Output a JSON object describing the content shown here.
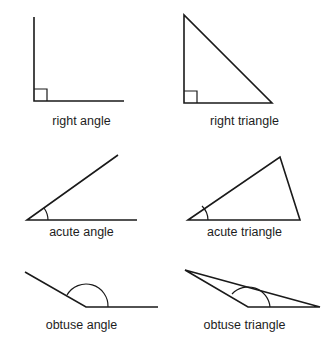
{
  "sheet": {
    "title": "Angle and triangle classification figure sheet",
    "background_color": "#ffffff",
    "stroke_color": "#1a1a1a",
    "text_color": "#1d1d1d",
    "width": 326,
    "height": 345
  },
  "figures": [
    {
      "key": "right_angle",
      "caption": "right angle",
      "kind": "angle",
      "angle_degrees": 90,
      "angle_mark": "square",
      "vertex": [
        34,
        101
      ],
      "rays": [
        [
          34,
          17
        ],
        [
          124,
          101
        ]
      ]
    },
    {
      "key": "right_triangle",
      "caption": "right triangle",
      "kind": "triangle",
      "angle_mark": "square",
      "vertices": [
        [
          184,
          15
        ],
        [
          184,
          103
        ],
        [
          272,
          103
        ]
      ],
      "right_angle_at": [
        184,
        103
      ]
    },
    {
      "key": "acute_angle",
      "caption": "acute angle",
      "kind": "angle",
      "angle_degrees": 35,
      "angle_mark": "arc",
      "vertex": [
        27,
        220
      ],
      "rays": [
        [
          118,
          155
        ],
        [
          137,
          220
        ]
      ]
    },
    {
      "key": "acute_triangle",
      "caption": "acute triangle",
      "kind": "triangle",
      "angle_mark": "arc",
      "vertices": [
        [
          188,
          220
        ],
        [
          280,
          157
        ],
        [
          300,
          220
        ]
      ],
      "marked_angle_at": [
        188,
        220
      ]
    },
    {
      "key": "obtuse_angle",
      "caption": "obtuse angle",
      "kind": "angle",
      "angle_degrees": 150,
      "angle_mark": "arc",
      "vertex": [
        86,
        307
      ],
      "rays": [
        [
          25,
          272
        ],
        [
          158,
          307
        ]
      ]
    },
    {
      "key": "obtuse_triangle",
      "caption": "obtuse triangle",
      "kind": "triangle",
      "angle_mark": "arc",
      "vertices": [
        [
          185,
          270
        ],
        [
          248,
          307
        ],
        [
          320,
          307
        ]
      ],
      "marked_angle_at": [
        248,
        307
      ]
    }
  ],
  "captions": {
    "right_angle": "right angle",
    "right_triangle": "right triangle",
    "acute_angle": "acute angle",
    "acute_triangle": "acute triangle",
    "obtuse_angle": "obtuse angle",
    "obtuse_triangle": "obtuse triangle"
  }
}
